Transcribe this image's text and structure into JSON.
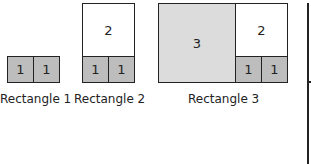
{
  "rectangles": [
    {
      "label": "Rectangle 1",
      "cells": [
        "1",
        "1"
      ]
    },
    {
      "label": "Rectangle 2",
      "cells": [
        "2",
        "1",
        "1"
      ]
    },
    {
      "label": "Rectangle 3",
      "cells": [
        "3",
        "2",
        "1",
        "1"
      ]
    }
  ],
  "colors": {
    "dark": "#bdbdbd",
    "light": "#dcdcdc",
    "white": "#ffffff",
    "stroke": "#222222"
  }
}
